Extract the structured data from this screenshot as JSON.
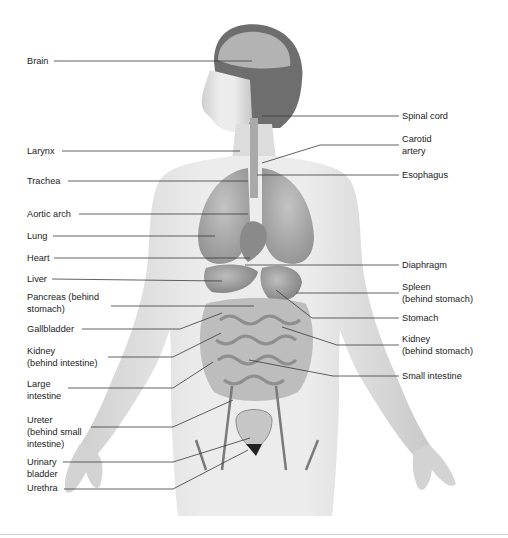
{
  "diagram": {
    "colors": {
      "line": "#3a3a3a",
      "skin": "#e4e4e4",
      "organ_dark": "#8c8c8c",
      "organ_mid": "#b4b4b4",
      "bladder": "#c9c9c9",
      "rule": "#cfcfcf"
    },
    "left_labels": [
      {
        "id": "brain",
        "text": "Brain",
        "x": 27,
        "y": 55,
        "lx1": 54,
        "ly": 61,
        "ex": 252,
        "ey": 61
      },
      {
        "id": "larynx",
        "text": "Larynx",
        "x": 27,
        "y": 145,
        "lx1": 62,
        "ly": 151,
        "ex": 240,
        "ey": 151
      },
      {
        "id": "trachea",
        "text": "Trachea",
        "x": 27,
        "y": 175,
        "lx1": 68,
        "ly": 181,
        "ex": 248,
        "ey": 181
      },
      {
        "id": "aortic-arch",
        "text": "Aortic arch",
        "x": 27,
        "y": 208,
        "lx1": 79,
        "ly": 214,
        "ex": 248,
        "ey": 214
      },
      {
        "id": "lung",
        "text": "Lung",
        "x": 27,
        "y": 230,
        "lx1": 53,
        "ly": 236,
        "ex": 215,
        "ey": 236
      },
      {
        "id": "heart",
        "text": "Heart",
        "x": 27,
        "y": 252,
        "lx1": 54,
        "ly": 258,
        "ex": 250,
        "ey": 258
      },
      {
        "id": "liver",
        "text": "Liver",
        "x": 27,
        "y": 273,
        "lx1": 52,
        "ly": 279,
        "ex": 222,
        "ey": 281
      },
      {
        "id": "pancreas",
        "text": "Pancreas (behind\nstomach)",
        "x": 27,
        "y": 291,
        "lx1": 111,
        "ly": 306,
        "ex": 254,
        "ey": 306
      },
      {
        "id": "gallbladder",
        "text": "Gallbladder",
        "x": 27,
        "y": 323,
        "lx1": 82,
        "ly": 329,
        "ex": 222,
        "ey": 313,
        "bx": 180
      },
      {
        "id": "kidney-left",
        "text": "Kidney\n(behind intestine)",
        "x": 27,
        "y": 345,
        "lx1": 108,
        "ly": 357,
        "ex": 221,
        "ey": 333,
        "bx": 173
      },
      {
        "id": "large-intestine",
        "text": "Large\nintestine",
        "x": 27,
        "y": 378,
        "lx1": 68,
        "ly": 388,
        "ex": 213,
        "ey": 362,
        "bx": 173
      },
      {
        "id": "ureter",
        "text": "Ureter\n(behind small\nintestine)",
        "x": 27,
        "y": 414,
        "lx1": 91,
        "ly": 427,
        "ex": 233,
        "ey": 400,
        "bx": 173
      },
      {
        "id": "urinary-bladder",
        "text": "Urinary\nbladder",
        "x": 27,
        "y": 456,
        "lx1": 63,
        "ly": 462,
        "ex": 250,
        "ey": 438,
        "bx": 173
      },
      {
        "id": "urethra",
        "text": "Urethra",
        "x": 27,
        "y": 482,
        "lx1": 64,
        "ly": 489,
        "ex": 248,
        "ey": 450,
        "bx": 173
      }
    ],
    "right_labels": [
      {
        "id": "spinal-cord",
        "text": "Spinal cord",
        "x": 402,
        "y": 110,
        "lx2": 399,
        "ly": 116,
        "ex": 262,
        "ey": 116
      },
      {
        "id": "carotid-artery",
        "text": "Carotid\nartery",
        "x": 402,
        "y": 133,
        "lx2": 399,
        "ly": 145,
        "ex": 262,
        "ey": 163,
        "bx": 320
      },
      {
        "id": "esophagus",
        "text": "Esophagus",
        "x": 402,
        "y": 169,
        "lx2": 399,
        "ly": 175,
        "ex": 257,
        "ey": 175
      },
      {
        "id": "diaphragm",
        "text": "Diaphragm",
        "x": 402,
        "y": 259,
        "lx2": 399,
        "ly": 265,
        "ex": 245,
        "ey": 265
      },
      {
        "id": "spleen",
        "text": "Spleen\n(behind stomach)",
        "x": 402,
        "y": 281,
        "lx2": 399,
        "ly": 293,
        "ex": 296,
        "ey": 293
      },
      {
        "id": "stomach",
        "text": "Stomach",
        "x": 402,
        "y": 312,
        "lx2": 399,
        "ly": 318,
        "ex": 276,
        "ey": 290,
        "bx": 312
      },
      {
        "id": "kidney-right",
        "text": "Kidney\n(behind stomach)",
        "x": 402,
        "y": 333,
        "lx2": 399,
        "ly": 345,
        "ex": 282,
        "ey": 327,
        "bx": 337
      },
      {
        "id": "small-intestine",
        "text": "Small intestine",
        "x": 402,
        "y": 370,
        "lx2": 399,
        "ly": 376,
        "ex": 249,
        "ey": 360,
        "bx": 333
      }
    ]
  }
}
